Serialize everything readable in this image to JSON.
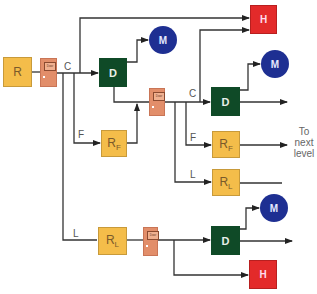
{
  "nodes": {
    "root": {
      "label": "R"
    },
    "door1": {
      "label": "Door"
    },
    "door2": {
      "label": "Door"
    },
    "door3": {
      "label": "Door"
    },
    "d1": {
      "label": "D"
    },
    "d2": {
      "label": "D"
    },
    "d3": {
      "label": "D"
    },
    "m1": {
      "label": "M"
    },
    "m2": {
      "label": "M"
    },
    "m3": {
      "label": "M"
    },
    "h1": {
      "label": "H"
    },
    "h2": {
      "label": "H"
    },
    "rf1": {
      "label": "R",
      "sub": "F"
    },
    "rf2": {
      "label": "R",
      "sub": "F"
    },
    "rl1": {
      "label": "R",
      "sub": "L"
    },
    "rl2": {
      "label": "R",
      "sub": "L"
    }
  },
  "edge_labels": {
    "c1": "C",
    "f1": "F",
    "l1": "L",
    "c2": "C",
    "f2": "F",
    "l2": "L"
  },
  "annotation": {
    "line1": "To",
    "line2": "next",
    "line3": "level"
  },
  "colors": {
    "r": "#f4bd4a",
    "d": "#0f4a27",
    "h": "#e32a2a",
    "m": "#1e2f92",
    "door": "#e28e6a",
    "line": "#333333"
  }
}
